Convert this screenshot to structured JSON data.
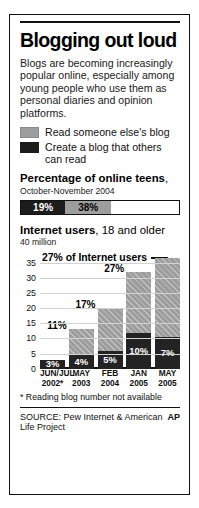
{
  "title": "Blogging out loud",
  "deck": "Blogs are becoming increasingly popular online, especially among young people who use them as personal diaries and opinion platforms.",
  "legend": [
    {
      "label": "Read someone else's blog",
      "color": "#9d9d9d",
      "key": "read"
    },
    {
      "label": "Create a blog that others can read",
      "color": "#1c1c1c",
      "key": "create"
    }
  ],
  "teens": {
    "heading_bold": "Percentage of online teens",
    "heading_tail": ",",
    "subhead": "October-November 2004",
    "create_value": "19%",
    "read_value": "38%"
  },
  "internet": {
    "heading_bold": "Internet users",
    "heading_tail": ", 18 and older",
    "unit_label": "40 million",
    "callout": "27% of Internet users"
  },
  "footnote": "* Reading blog number not available",
  "source": "SOURCE: Pew Internet & American Life Project",
  "credit": "AP",
  "chart_data": {
    "type": "bar",
    "subtype": "stacked-vertical",
    "title": "Internet users, 18 and older",
    "ylabel": "40 million",
    "xlabel": "",
    "ylim": [
      0,
      40
    ],
    "yticks": [
      "35",
      "30",
      "25",
      "20",
      "15",
      "10",
      "5",
      "0"
    ],
    "ytick_values": [
      35,
      30,
      25,
      20,
      15,
      10,
      5,
      0
    ],
    "grid": true,
    "legend_position": "top",
    "categories": [
      "JUN/JUL 2002*",
      "MAY 2003",
      "FEB 2004",
      "JAN 2005",
      "MAY 2005"
    ],
    "category_lines": [
      [
        "JUN/JUL",
        "2002*"
      ],
      [
        "MAY",
        "2003"
      ],
      [
        "FEB",
        "2004"
      ],
      [
        "JAN",
        "2005"
      ],
      [
        "MAY",
        "2005"
      ]
    ],
    "series": [
      {
        "name": "Create a blog that others can read",
        "color": "#232323",
        "values": [
          3.0,
          4.5,
          6.0,
          11.7,
          10.3
        ],
        "labels": [
          "3%",
          "4%",
          "5%",
          "10%",
          "7%"
        ]
      },
      {
        "name": "Read someone else's blog",
        "color": "#9d9d9d",
        "values": [
          0,
          8.5,
          14.2,
          20.3,
          26.2
        ],
        "labels": [
          "",
          "",
          "",
          "",
          ""
        ]
      }
    ],
    "totals": [
      3.0,
      13.0,
      20.2,
      32.0,
      36.5
    ],
    "total_labels": [
      "",
      "11%",
      "17%",
      "27%",
      ""
    ],
    "annotations": [
      {
        "text": "27% of Internet users",
        "target_category": "MAY 2005",
        "has_leader_line": true
      }
    ]
  }
}
